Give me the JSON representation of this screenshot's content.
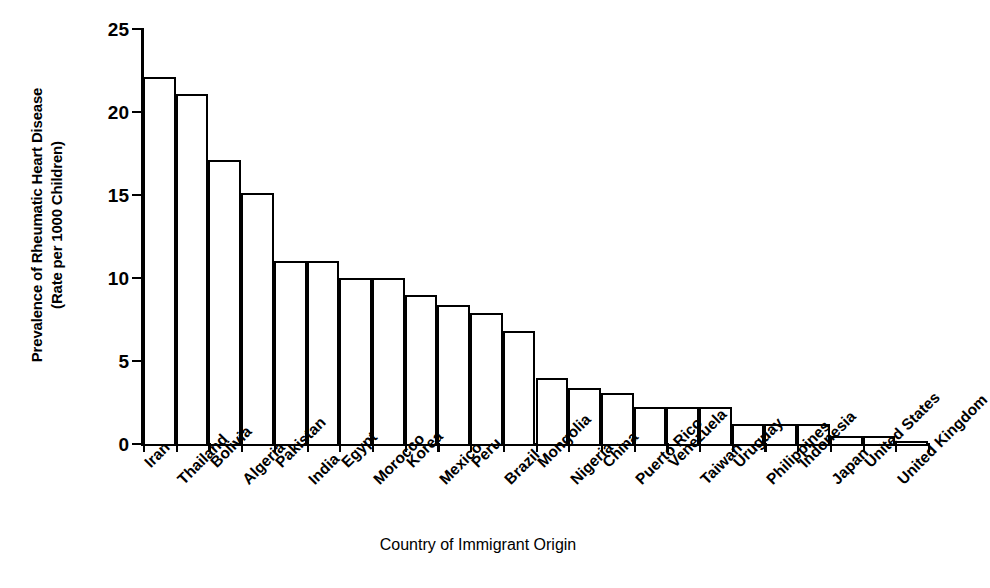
{
  "chart_data": {
    "type": "bar",
    "title": "",
    "xlabel": "Country of Immigrant Origin",
    "ylabel_line1": "Prevalence of Rheumatic Heart Disease",
    "ylabel_line2": "(Rate per 1000 Children)",
    "ylim": [
      0,
      25
    ],
    "yticks": [
      0,
      5,
      10,
      15,
      20,
      25
    ],
    "grid": false,
    "legend": "none",
    "categories": [
      "Iran",
      "Thailand",
      "Bolivia",
      "Algeria",
      "Pakistan",
      "India",
      "Egypt",
      "Morocco",
      "Korea",
      "Mexico",
      "Peru",
      "Brazil",
      "Mongolia",
      "Nigeria",
      "China",
      "Puerto Rico",
      "Venezuela",
      "Taiwan",
      "Uruguay",
      "Philippines",
      "Indonesia",
      "Japan",
      "United States",
      "United Kingdom"
    ],
    "values": [
      22.1,
      21.1,
      17.1,
      15.1,
      11.0,
      11.0,
      10.0,
      10.0,
      9.0,
      8.4,
      7.9,
      6.8,
      4.0,
      3.4,
      3.1,
      2.2,
      2.2,
      2.2,
      1.2,
      1.2,
      1.2,
      0.5,
      0.5,
      0.2
    ],
    "bar_style": {
      "fill": "#ffffff",
      "edge": "#000000"
    }
  }
}
